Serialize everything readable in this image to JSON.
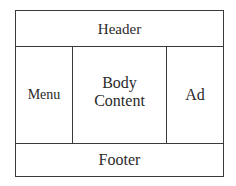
{
  "diagram": {
    "regions": {
      "header": "Header",
      "menu": "Menu",
      "body_line1": "Body",
      "body_line2": "Content",
      "ad": "Ad",
      "footer": "Footer"
    },
    "colors": {
      "border": "#3a3a3a",
      "text": "#2a2a2a",
      "background": "#ffffff"
    }
  }
}
